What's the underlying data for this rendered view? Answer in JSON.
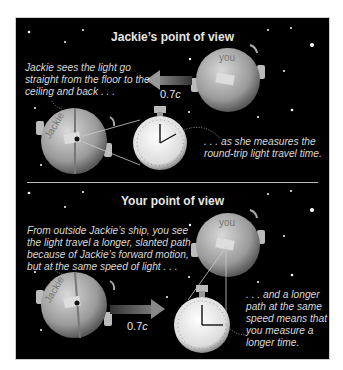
{
  "top_panel": {
    "title": "Jackie’s point of view",
    "caption_left": "Jackie sees the light go\nstraight from the floor to the\nceiling and back . . .",
    "caption_right": ". . . as she measures the\nround-trip light travel time.",
    "speed_value": "0.7",
    "speed_unit": "c",
    "ship_jackie_label": "Jackie",
    "ship_you_label": "you",
    "arrow_direction": "left"
  },
  "bottom_panel": {
    "title": "Your point of view",
    "caption_left": "From outside Jackie’s ship, you see\nthe light travel a longer, slanted path\nbecause of Jackie’s forward motion,\nbut at the same speed of light . . .",
    "caption_right": ". . . and a longer\npath at the same\nspeed means that\nyou measure a\nlonger time.",
    "speed_value": "0.7",
    "speed_unit": "c",
    "ship_jackie_label": "Jackie",
    "ship_you_label": "you",
    "arrow_direction": "right"
  },
  "colors": {
    "background": "#000000",
    "text": "#d9d9d9",
    "ship": "#b0b0b0",
    "arrow": "#555555"
  }
}
